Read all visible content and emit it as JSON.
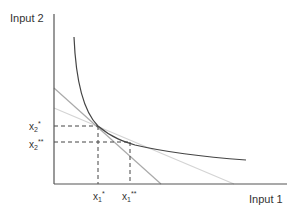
{
  "diagram": {
    "title": "",
    "axes": {
      "x_label": "Input 1",
      "y_label": "Input 2"
    },
    "points": {
      "x1_star": {
        "base": "x",
        "sub": "1",
        "sup": "*"
      },
      "x1_double_star": {
        "base": "x",
        "sub": "1",
        "sup": "**"
      },
      "x2_star": {
        "base": "x",
        "sub": "2",
        "sup": "*"
      },
      "x2_double_star": {
        "base": "x",
        "sub": "2",
        "sup": "**"
      }
    },
    "elements": [
      {
        "type": "curve",
        "name": "isoquant",
        "color": "#444444"
      },
      {
        "type": "line",
        "name": "isocost-line-1",
        "color": "#aaaaaa"
      },
      {
        "type": "line",
        "name": "isocost-line-2",
        "color": "#d4d4d4"
      },
      {
        "type": "dashed-guides",
        "color": "#444444"
      }
    ],
    "colors": {
      "axis": "#555555",
      "curve": "#444444",
      "line_dark": "#aaaaaa",
      "line_light": "#d4d4d4",
      "guides": "#444444"
    }
  }
}
